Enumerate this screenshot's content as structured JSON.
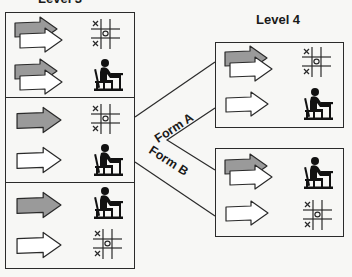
{
  "levels": {
    "left": {
      "label": "Level 3"
    },
    "right": {
      "label": "Level 4"
    }
  },
  "connectors": {
    "form_a": {
      "label": "Form A"
    },
    "form_b": {
      "label": "Form B"
    }
  },
  "left_panels": [
    {
      "rows": [
        {
          "arrow": "gray-over-white-arrows",
          "icon": "tic-tac-toe-icon"
        },
        {
          "arrow": "gray-over-white-arrows",
          "icon": "student-at-desk-icon"
        }
      ]
    },
    {
      "rows": [
        {
          "arrow": "gray-arrow",
          "icon": "tic-tac-toe-icon"
        },
        {
          "arrow": "white-arrow",
          "icon": "student-at-desk-icon"
        }
      ]
    },
    {
      "rows": [
        {
          "arrow": "gray-arrow",
          "icon": "student-at-desk-icon"
        },
        {
          "arrow": "white-arrow",
          "icon": "tic-tac-toe-icon"
        }
      ]
    }
  ],
  "right_panels": [
    {
      "form": "Form A",
      "rows": [
        {
          "arrow": "gray-over-white-arrows",
          "icon": "tic-tac-toe-icon"
        },
        {
          "arrow": "white-arrow",
          "icon": "student-at-desk-icon"
        }
      ]
    },
    {
      "form": "Form B",
      "rows": [
        {
          "arrow": "gray-over-white-arrows",
          "icon": "student-at-desk-icon"
        },
        {
          "arrow": "white-arrow",
          "icon": "tic-tac-toe-icon"
        }
      ]
    }
  ],
  "tictactoe": {
    "x_mark": "x",
    "o_mark": "o"
  },
  "colors": {
    "gray_arrow": "#9a9a9a",
    "white_arrow": "#ffffff",
    "stroke": "#2a2a2a"
  }
}
